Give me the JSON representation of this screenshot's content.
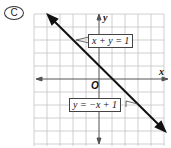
{
  "choice": {
    "label": "C"
  },
  "graph": {
    "x_axis_label": "x",
    "y_axis_label": "y",
    "origin_label": "O",
    "line_labels": [
      "x + y = 1",
      "y = −x + 1"
    ],
    "line_color": "#111111",
    "grid_color": "#bbbbbb"
  }
}
